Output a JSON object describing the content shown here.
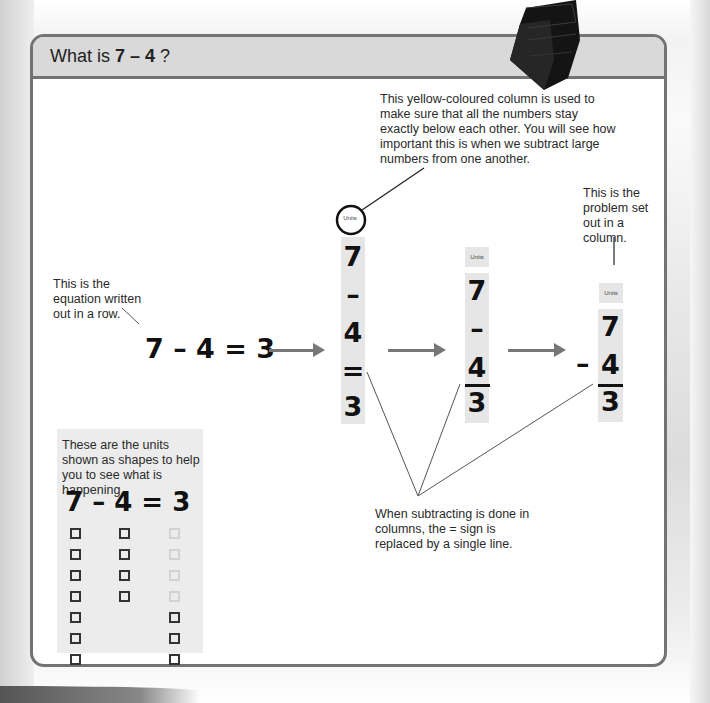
{
  "header": {
    "title_prefix": "What is ",
    "title_expression": "7 – 4",
    "title_suffix": " ?"
  },
  "annotations": {
    "yellow_column": "This yellow-coloured column is used to make sure that all the numbers stay exactly below each other. You will see how important this is when we subtract large numbers from one another.",
    "problem_column": "This is the problem set out in a column.",
    "equation_row": "This is the equation written out in a row.",
    "shapes": "These are the units shown as shapes to help you to see what is happening.",
    "line_replaces_equals": "When subtracting is done in columns, the = sign is replaced by a single line."
  },
  "row_equation": "7 – 4 = 3",
  "column_1": {
    "units_label": "Units",
    "items": [
      "7",
      "–",
      "4",
      "=",
      "3"
    ]
  },
  "column_2": {
    "units_label": "Units",
    "items": [
      "7",
      "–",
      "4",
      "3"
    ]
  },
  "column_3": {
    "units_label": "Units",
    "minus": "–",
    "items": [
      "7",
      "4",
      "3"
    ]
  },
  "shapes_panel": {
    "equation": "7 – 4 = 3",
    "minuend_count": 7,
    "subtrahend_count": 4,
    "result_count": 3,
    "faded_count": 4
  },
  "colors": {
    "frame": "#737373",
    "header_bg": "#d9d9d9",
    "column_bg": "#e6e6e6",
    "arrow": "#777777"
  }
}
